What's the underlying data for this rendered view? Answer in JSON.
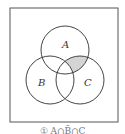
{
  "diagram": {
    "type": "venn",
    "sets": [
      {
        "label": "A",
        "cx": 65,
        "cy": 50,
        "r": 24
      },
      {
        "label": "B",
        "cx": 50,
        "cy": 80,
        "r": 24
      },
      {
        "label": "C",
        "cx": 80,
        "cy": 80,
        "r": 24
      }
    ],
    "shaded_region": "A ∩ C ∩ not B",
    "shade_color": "#d4d4d4",
    "stroke_color": "#444444",
    "frame": {
      "x": 10,
      "y": 8,
      "width": 108,
      "height": 114
    }
  },
  "labels": {
    "a": "A",
    "b": "B",
    "c": "C"
  },
  "caption": "① A∩B̄∩C"
}
